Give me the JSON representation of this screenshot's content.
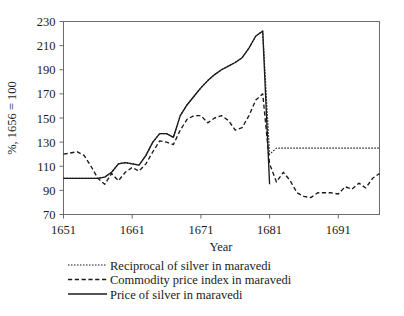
{
  "chart_data": {
    "type": "line",
    "title": "",
    "xlabel": "Year",
    "ylabel": "%, 1656 = 100",
    "xlim": [
      1651,
      1697
    ],
    "ylim": [
      70,
      230
    ],
    "yticks": [
      70,
      90,
      110,
      130,
      150,
      170,
      190,
      210,
      230
    ],
    "xticks": [
      1651,
      1661,
      1671,
      1681,
      1691
    ],
    "ytick_labels": [
      "70",
      "90",
      "110",
      "130",
      "150",
      "170",
      "190",
      "210",
      "230"
    ],
    "xtick_labels": [
      "1651",
      "1661",
      "1671",
      "1681",
      "1691"
    ],
    "grid": false,
    "legend_position": "below-left",
    "x": [
      1651,
      1652,
      1653,
      1654,
      1655,
      1656,
      1657,
      1658,
      1659,
      1660,
      1661,
      1662,
      1663,
      1664,
      1665,
      1666,
      1667,
      1668,
      1669,
      1670,
      1671,
      1672,
      1673,
      1674,
      1675,
      1676,
      1677,
      1678,
      1679,
      1680,
      1681,
      1682,
      1683,
      1684,
      1685,
      1686,
      1687,
      1688,
      1689,
      1690,
      1691,
      1692,
      1693,
      1694,
      1695,
      1696,
      1697
    ],
    "series": [
      {
        "name": "Reciprocal of silver in maravedi",
        "style": "dotted",
        "values": [
          100,
          100,
          100,
          100,
          100,
          100,
          101,
          105,
          112,
          113,
          112,
          111,
          119,
          130,
          137,
          137,
          134,
          152,
          161,
          168,
          175,
          181,
          186,
          190,
          193,
          196,
          200,
          208,
          218,
          222,
          120,
          125,
          125,
          125,
          125,
          125,
          125,
          125,
          125,
          125,
          125,
          125,
          125,
          125,
          125,
          125,
          125
        ]
      },
      {
        "name": "Commodity price index in maravedi",
        "style": "dashed",
        "values": [
          120,
          121,
          122,
          119,
          110,
          100,
          95,
          104,
          98,
          105,
          109,
          106,
          112,
          122,
          131,
          130,
          128,
          140,
          149,
          152,
          152,
          146,
          150,
          152,
          148,
          140,
          142,
          152,
          165,
          170,
          112,
          97,
          105,
          98,
          88,
          85,
          84,
          88,
          88,
          88,
          87,
          93,
          91,
          96,
          92,
          100,
          104
        ]
      },
      {
        "name": "Price of silver in maravedi",
        "style": "solid",
        "values": [
          100,
          100,
          100,
          100,
          100,
          100,
          101,
          105,
          112,
          113,
          112,
          111,
          119,
          130,
          137,
          137,
          134,
          152,
          161,
          168,
          175,
          181,
          186,
          190,
          193,
          196,
          200,
          208,
          218,
          222,
          95,
          null,
          null,
          null,
          null,
          null,
          null,
          null,
          null,
          null,
          null,
          null,
          null,
          null,
          null,
          null,
          null
        ]
      }
    ],
    "legend": [
      {
        "label": "Reciprocal of silver in maravedi",
        "style": "dotted"
      },
      {
        "label": "Commodity price index in maravedi",
        "style": "dashed"
      },
      {
        "label": "Price of silver in maravedi",
        "style": "solid"
      }
    ]
  },
  "colors": {
    "ink": "#1a1a1a",
    "axis": "#6b6b6b",
    "background": "#ffffff"
  }
}
